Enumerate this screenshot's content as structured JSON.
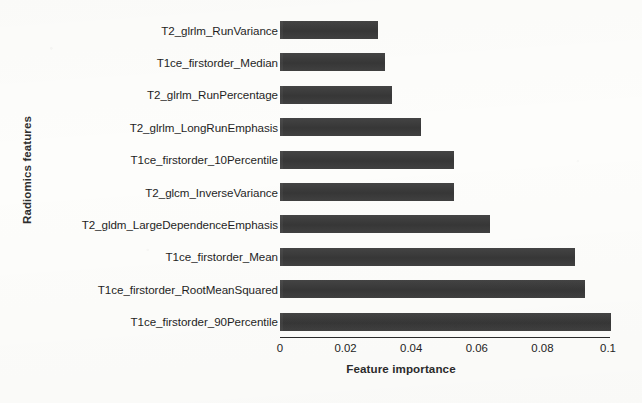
{
  "chart_data": {
    "type": "bar",
    "orientation": "horizontal",
    "title": "",
    "subtitle": "",
    "xlabel": "Feature importance",
    "ylabel": "Radiomics features",
    "xlim": [
      0,
      0.1
    ],
    "xticks": [
      "0",
      "0.02",
      "0.04",
      "0.06",
      "0.08",
      "0.1"
    ],
    "xtick_values": [
      0,
      0.02,
      0.04,
      0.06,
      0.08,
      0.1
    ],
    "grid": false,
    "legend": null,
    "bar_color": "#3a3a3a",
    "background_color": "#fdfdfb",
    "categories": [
      "T2_glrlm_RunVariance",
      "T1ce_firstorder_Median",
      "T2_glrlm_RunPercentage",
      "T2_glrlm_LongRunEmphasis",
      "T1ce_firstorder_10Percentile",
      "T2_glcm_InverseVariance",
      "T2_gldm_LargeDependenceEmphasis",
      "T1ce_firstorder_Mean",
      "T1ce_firstorder_RootMeanSquared",
      "T1ce_firstorder_90Percentile"
    ],
    "values": [
      0.03,
      0.032,
      0.034,
      0.043,
      0.053,
      0.053,
      0.064,
      0.09,
      0.093,
      0.101
    ]
  }
}
